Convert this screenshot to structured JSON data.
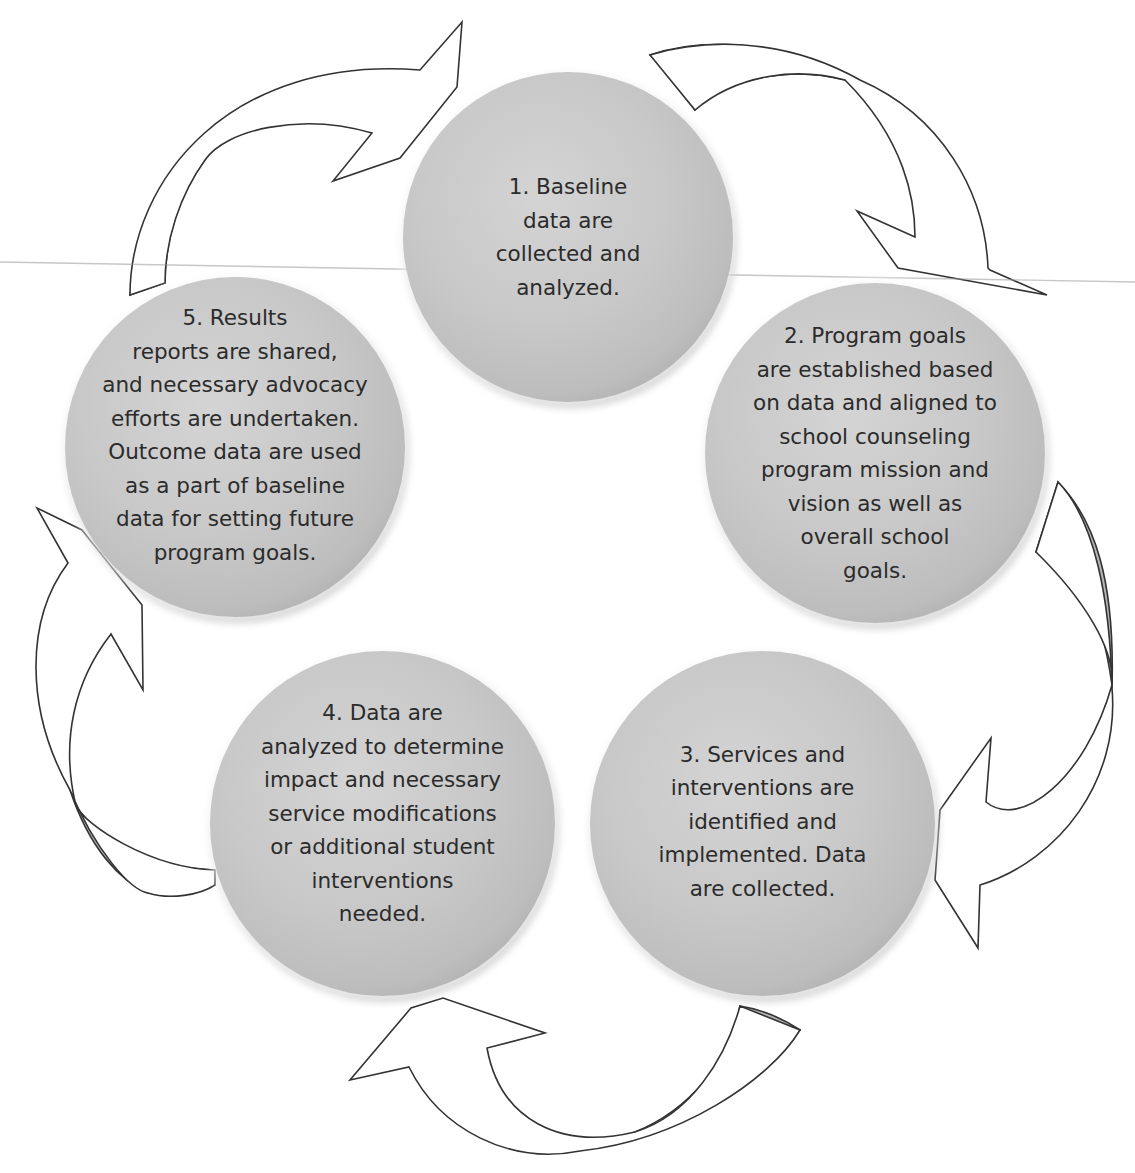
{
  "diagram": {
    "type": "cycle",
    "direction": "clockwise",
    "colors": {
      "circle_fill": "#c8c8c8",
      "circle_edge": "#555555",
      "arrow_fill": "#ffffff",
      "arrow_shade": "#b4b4b4",
      "arrow_outline": "#333333",
      "text": "#2b2b2b"
    },
    "steps": [
      {
        "number": 1,
        "text": "1. Baseline\ndata are\ncollected and\nanalyzed."
      },
      {
        "number": 2,
        "text": "2. Program goals\nare established based\non data and aligned to\nschool counseling\nprogram mission and\nvision as well as\noverall school\ngoals."
      },
      {
        "number": 3,
        "text": "3. Services and\ninterventions are\nidentified and\nimplemented. Data\nare collected."
      },
      {
        "number": 4,
        "text": "4. Data are\nanalyzed to determine\nimpact and necessary\nservice modifications\nor additional student\ninterventions\nneeded."
      },
      {
        "number": 5,
        "text": "5. Results\nreports are shared,\nand necessary advocacy\nefforts are undertaken.\nOutcome data are used\nas a part of baseline\ndata for setting future\nprogram goals."
      }
    ],
    "arrows": [
      {
        "from": 5,
        "to": 1,
        "icon": "curved-arrow-icon"
      },
      {
        "from": 1,
        "to": 2,
        "icon": "curved-arrow-icon"
      },
      {
        "from": 2,
        "to": 3,
        "icon": "curved-arrow-icon"
      },
      {
        "from": 3,
        "to": 4,
        "icon": "curved-arrow-icon"
      },
      {
        "from": 4,
        "to": 5,
        "icon": "curved-arrow-icon"
      }
    ]
  }
}
